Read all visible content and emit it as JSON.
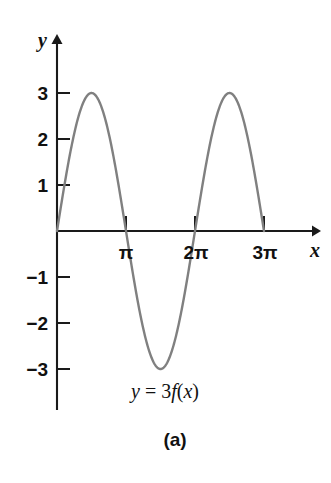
{
  "figure": {
    "caption": "(a)",
    "curve_label": {
      "lhs": "y",
      "equals": " = ",
      "coefficient": "3",
      "function": "f",
      "open": "(",
      "argument": "x",
      "close": ")",
      "full_text": "y = 3f(x)"
    },
    "axis_labels": {
      "x": "x",
      "y": "y"
    },
    "colors": {
      "curve": "#808080",
      "axis": "#1a1a1a",
      "text": "#111111",
      "background": "#ffffff"
    }
  },
  "chart_data": {
    "type": "line",
    "title": "y = 3f(x)",
    "xlabel": "x",
    "ylabel": "y",
    "grid": false,
    "legend": null,
    "annotations": [
      "y = 3f(x)",
      "(a)"
    ],
    "function": "y = 3 sin(x)",
    "amplitude": 3,
    "period": "2π",
    "xlim": [
      0,
      10.5
    ],
    "ylim": [
      -3.6,
      3.6
    ],
    "xticks": [
      3.141592653589793,
      6.283185307179586,
      9.42477796076938
    ],
    "xticklabels": [
      "π",
      "2π",
      "3π"
    ],
    "yticks": [
      -3,
      -2,
      -1,
      1,
      2,
      3
    ],
    "yticklabels": [
      "−3",
      "−2",
      "−1",
      "1",
      "2",
      "3"
    ],
    "key_points": [
      {
        "x": 0,
        "y": 0,
        "note": "origin"
      },
      {
        "x": 1.5707963267948966,
        "y": 3,
        "note": "maximum at π/2"
      },
      {
        "x": 3.141592653589793,
        "y": 0,
        "note": "zero at π"
      },
      {
        "x": 4.71238898038469,
        "y": -3,
        "note": "minimum at 3π/2"
      },
      {
        "x": 6.283185307179586,
        "y": 0,
        "note": "zero at 2π"
      },
      {
        "x": 7.853981633974483,
        "y": 3,
        "note": "maximum at 5π/2"
      },
      {
        "x": 9.42477796076938,
        "y": 0,
        "note": "zero at 3π"
      }
    ],
    "x": [
      0,
      0.2,
      0.4,
      0.6,
      0.8,
      1.0,
      1.2,
      1.4,
      1.5708,
      1.8,
      2.0,
      2.2,
      2.4,
      2.6,
      2.8,
      3.0,
      3.1416,
      3.4,
      3.6,
      3.8,
      4.0,
      4.2,
      4.4,
      4.6,
      4.7124,
      5.0,
      5.2,
      5.4,
      5.6,
      5.8,
      6.0,
      6.2832,
      6.5,
      6.8,
      7.0,
      7.2,
      7.4,
      7.6,
      7.854,
      8.1,
      8.3,
      8.5,
      8.8,
      9.0,
      9.2,
      9.4248
    ],
    "y": [
      0,
      0.596,
      1.168,
      1.694,
      2.152,
      2.524,
      2.796,
      2.955,
      3.0,
      2.921,
      2.728,
      2.425,
      2.027,
      1.551,
      1.012,
      0.423,
      0,
      -0.768,
      -1.343,
      -1.837,
      -2.27,
      -2.622,
      -2.885,
      -2.985,
      -3.0,
      -2.877,
      -2.686,
      -2.396,
      -2.013,
      -1.45,
      -0.838,
      0,
      0.65,
      1.48,
      1.97,
      2.4,
      2.72,
      2.91,
      3.0,
      2.93,
      2.78,
      2.53,
      1.95,
      1.24,
      0.65,
      0
    ]
  }
}
